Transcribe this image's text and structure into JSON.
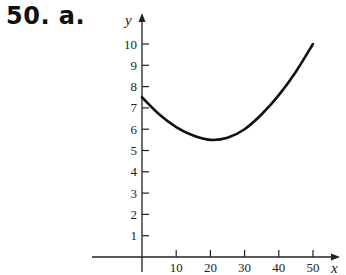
{
  "problem": {
    "label": "50. a."
  },
  "chart_data": {
    "type": "line",
    "title": "",
    "xlabel": "x",
    "ylabel": "y",
    "xlim": [
      0,
      50
    ],
    "ylim": [
      0,
      10
    ],
    "x_ticks": [
      10,
      20,
      30,
      40,
      50
    ],
    "y_ticks": [
      1,
      2,
      3,
      4,
      5,
      6,
      7,
      8,
      9,
      10
    ],
    "grid": false,
    "legend": null,
    "series": [
      {
        "name": "curve",
        "x": [
          0,
          5,
          10,
          15,
          20,
          25,
          30,
          35,
          40,
          45,
          50
        ],
        "y": [
          7.5,
          6.7,
          6.1,
          5.7,
          5.5,
          5.6,
          6.0,
          6.7,
          7.6,
          8.7,
          10.0
        ]
      }
    ],
    "colors": {
      "curve": "#111111",
      "axes": "#222222"
    }
  }
}
